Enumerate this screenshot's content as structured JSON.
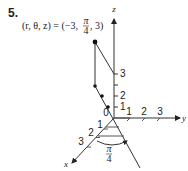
{
  "problem": {
    "number": "5.",
    "equation_lhs": "(r, θ, z) = (−3,",
    "equation_frac_num": "π",
    "equation_frac_den": "4",
    "equation_rhs": ", 3)"
  },
  "axes": {
    "x_label": "x",
    "y_label": "y",
    "z_label": "z",
    "origin_label": "0",
    "x_ticks": [
      "1",
      "2",
      "3"
    ],
    "y_ticks": [
      "1",
      "2",
      "3"
    ],
    "z_ticks": [
      "1",
      "2",
      "3"
    ]
  },
  "angle": {
    "num": "π",
    "den": "4"
  },
  "point": {
    "r": -3,
    "theta": "π/4",
    "z": 3
  }
}
